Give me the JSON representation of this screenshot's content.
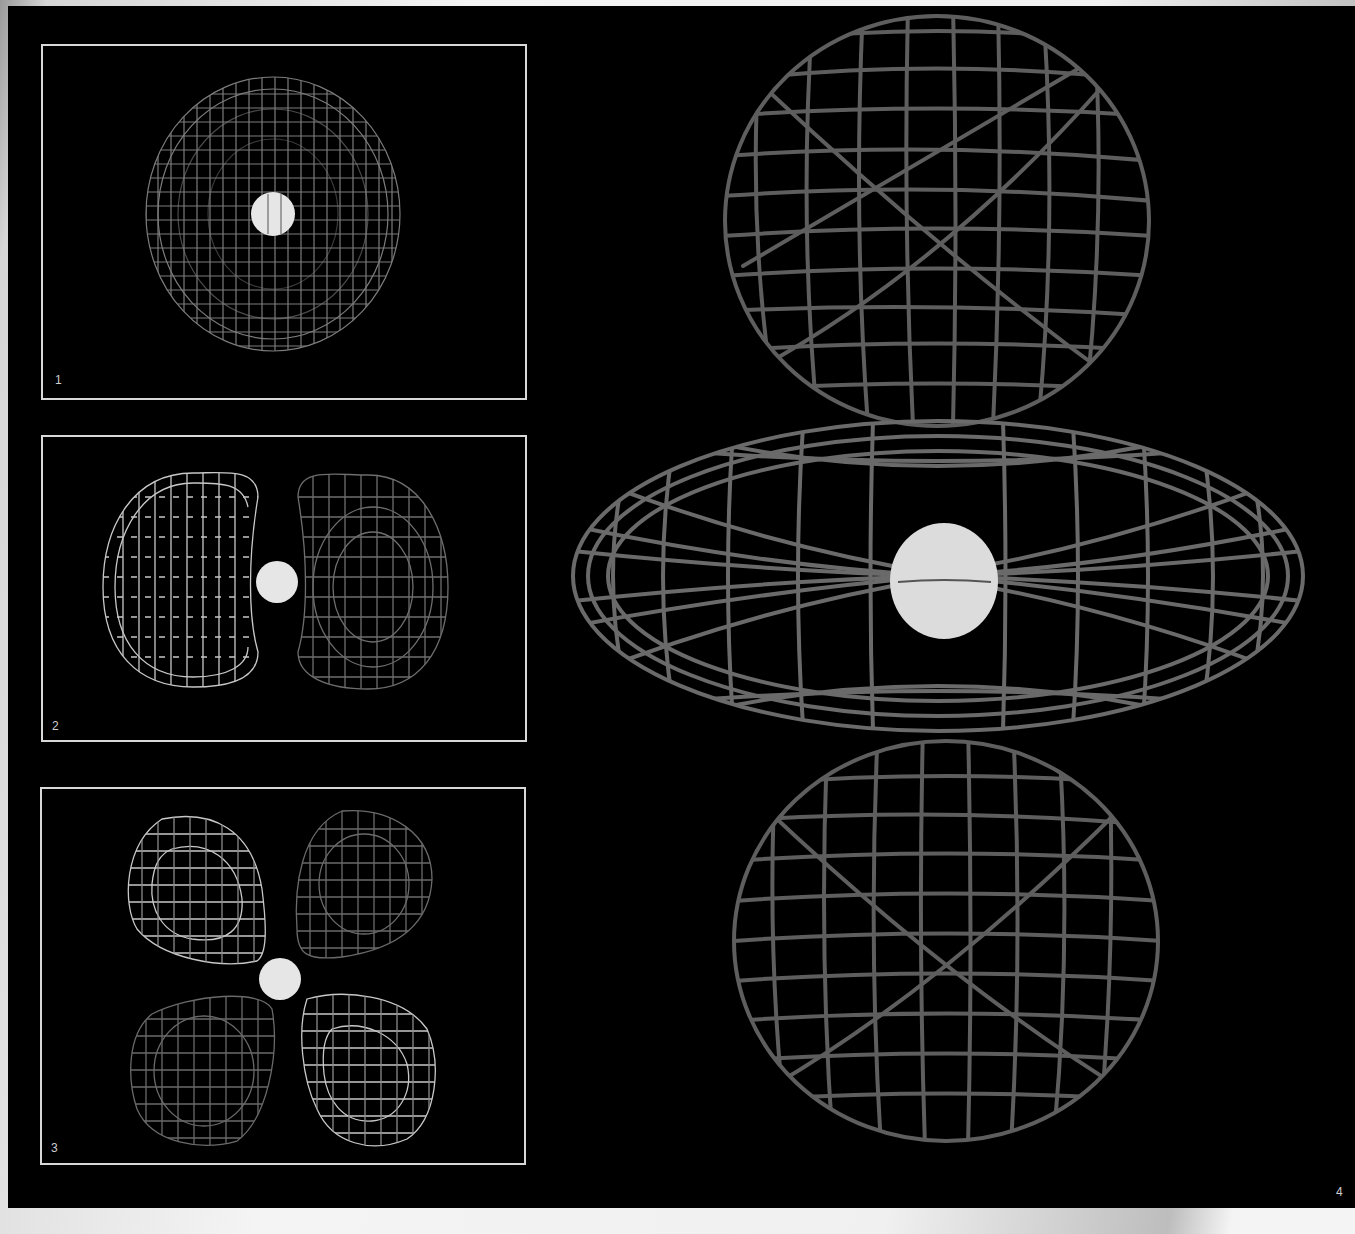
{
  "figure": {
    "background_color": "#000000",
    "frame_color": "#d8d8d8",
    "wire_color": "#8a8a8a",
    "nucleus_color": "#e6e6e6"
  },
  "panels": [
    {
      "label": "1",
      "shape": "s-orbital",
      "description": "spherical wireframe with central nucleus"
    },
    {
      "label": "2",
      "shape": "p-orbital",
      "description": "two lobes left and right of nucleus"
    },
    {
      "label": "3",
      "shape": "d-orbital",
      "description": "four cloverleaf lobes around nucleus"
    },
    {
      "label": "4",
      "shape": "dz2-orbital",
      "description": "two vertical lobes with equatorial torus around nucleus"
    }
  ]
}
